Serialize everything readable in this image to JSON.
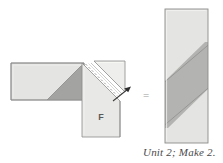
{
  "figure": {
    "kind": "quilt-piecing-diagram",
    "caption": "Unit 2; Make 2.",
    "equals_symbol": "=",
    "patch_label": "F",
    "colors": {
      "light_fabric": "#e4e4e2",
      "medium_fabric": "#b3b3b1",
      "dark_fabric": "#a3a3a1",
      "outline": "#8c8c8a",
      "stitch_line": "#9a9a98",
      "arrow": "#3a3a3a",
      "caption_text": "#4a4a4a",
      "background": "#ffffff"
    },
    "pieces": [
      {
        "name": "horizontal-strip",
        "description": "Light rectangle with dark diagonal triangle at right end",
        "x": 11,
        "y": 63,
        "width": 73,
        "height": 37
      },
      {
        "name": "vertical-strip-F",
        "description": "Light vertical rectangle labelled F with folded corner flap",
        "x": 82,
        "y": 63,
        "width": 38,
        "height": 74,
        "label": "F"
      },
      {
        "name": "folded-flap",
        "description": "Triangular flap folded back above the stitching line"
      },
      {
        "name": "stitch-line",
        "description": "Dashed diagonal sewing line",
        "style": "dashed"
      },
      {
        "name": "press-arrow",
        "description": "Arrow indicating direction to press/flip the flap",
        "direction": "up-right"
      },
      {
        "name": "finished-unit",
        "description": "Tall light rectangle crossed by a medium gray diagonal band",
        "x": 165,
        "y": 9,
        "width": 43,
        "height": 134
      }
    ]
  }
}
